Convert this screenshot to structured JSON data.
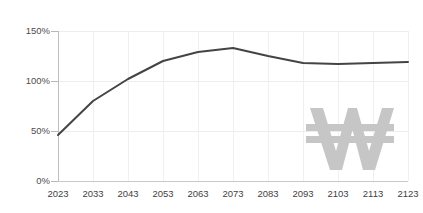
{
  "chart_data": {
    "type": "line",
    "title": "",
    "subtitle": "",
    "xlabel": "",
    "ylabel": "",
    "x": [
      2023,
      2033,
      2043,
      2053,
      2063,
      2073,
      2083,
      2093,
      2103,
      2113,
      2123
    ],
    "categories": [
      "2023",
      "2033",
      "2043",
      "2053",
      "2063",
      "2073",
      "2083",
      "2093",
      "2103",
      "2113",
      "2123"
    ],
    "series": [
      {
        "name": "",
        "values": [
          46,
          80,
          102,
          120,
          129,
          133,
          125,
          118,
          117,
          118,
          119
        ],
        "color": "#444444",
        "line_width": 2
      }
    ],
    "ylim": [
      0,
      150
    ],
    "yticks": [
      0,
      50,
      100,
      150
    ],
    "ytick_labels": [
      "0%",
      "50%",
      "100%",
      "150%"
    ],
    "xlim": [
      2023,
      2123
    ],
    "xticks": [
      2023,
      2033,
      2043,
      2053,
      2063,
      2073,
      2083,
      2093,
      2103,
      2113,
      2123
    ],
    "grid": {
      "horizontal": true,
      "vertical": true,
      "color": "#eeeeee"
    },
    "legend": {
      "visible": false,
      "position": "none",
      "entries": []
    },
    "annotations": [],
    "watermark": {
      "symbol": "₩",
      "name": "won-currency-watermark",
      "color": "#c6c6c6"
    },
    "background_color": "#ffffff",
    "axis_color": "#bdbdbd"
  },
  "axes": {
    "y_tick_labels": [
      "150%",
      "100%",
      "50%",
      "0%"
    ],
    "x_tick_labels": [
      "2023",
      "2033",
      "2043",
      "2053",
      "2063",
      "2073",
      "2083",
      "2093",
      "2103",
      "2113",
      "2123"
    ]
  }
}
